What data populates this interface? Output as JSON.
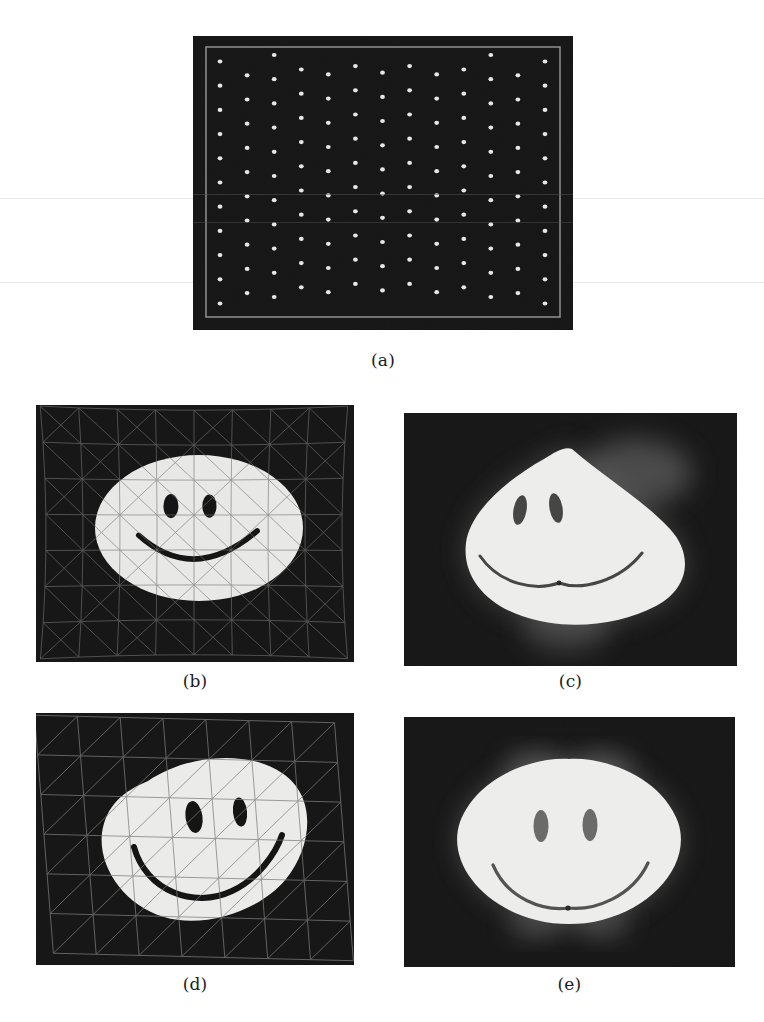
{
  "figure": {
    "page_background": "#ffffff",
    "panel_background": "#0a0a0a",
    "caption_color": "#1b1b1b",
    "panels": [
      {
        "id": "a",
        "caption": "(a)",
        "kind": "dot-grid-calibration-image",
        "description": "Dark calibration image showing a regular grid of bright white dots inside a thin light-gray rectangular frame",
        "frame_color": "#9a9a9a",
        "dot_color": "#f2f2f2",
        "grid_columns": 13,
        "grid_rows": 11,
        "column_shear_px": 9
      },
      {
        "id": "b",
        "caption": "(b)",
        "kind": "smiley-with-triangulated-mesh",
        "description": "Undeformed white elliptical smiley face on a dark background overlaid with a fine triangulated (Delaunay) mesh",
        "face_color": "#e8e8e6",
        "feature_color": "#0a0a0a",
        "mesh_color": "#6e6e6e",
        "mesh_cells_x": 8,
        "mesh_cells_y": 7,
        "mesh_style": "triangulated",
        "deformed": false
      },
      {
        "id": "c",
        "caption": "(c)",
        "kind": "warped-smiley-no-mesh",
        "description": "Strongly warped smiley face with a pointed top-center cusp and pinched mouth, soft glow halo, no mesh overlay",
        "face_color": "#ededeb",
        "feature_color": "#3c3c3c",
        "glow_color": "#5a5a5a",
        "deformed": true
      },
      {
        "id": "d",
        "caption": "(d)",
        "kind": "deformed-smiley-with-mesh",
        "description": "Rotated and deformed smiley face on a dark background overlaid with a coarse sheared triangulated mesh",
        "face_color": "#ebebe9",
        "feature_color": "#0a0a0a",
        "mesh_color": "#777777",
        "mesh_cells_x": 7,
        "mesh_cells_y": 6,
        "mesh_style": "sheared-triangulated",
        "deformed": true
      },
      {
        "id": "e",
        "caption": "(e)",
        "kind": "restored-smiley-no-mesh",
        "description": "Restored near-elliptical smiley face with small cusps at top and bottom center, soft glow halo, no mesh overlay",
        "face_color": "#ededeb",
        "feature_color": "#4a4a4a",
        "glow_color": "#5a5a5a",
        "deformed": false
      }
    ],
    "scanlines_y": [
      198,
      282
    ]
  }
}
